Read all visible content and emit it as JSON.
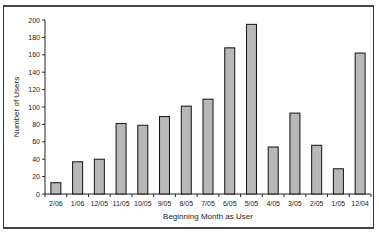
{
  "chart_data": {
    "type": "bar",
    "title": "",
    "xlabel": "Beginning Month as User",
    "ylabel": "Number of Users",
    "ylim": [
      0,
      200
    ],
    "yticks": [
      0,
      20,
      40,
      60,
      80,
      100,
      120,
      140,
      160,
      180,
      200
    ],
    "categories": [
      "2/06",
      "1/06",
      "12/05",
      "11/05",
      "10/05",
      "9/05",
      "8/05",
      "7/05",
      "6/05",
      "5/05",
      "4/05",
      "3/05",
      "2/05",
      "1/05",
      "12/04"
    ],
    "values": [
      13,
      37,
      40,
      81,
      79,
      89,
      101,
      109,
      168,
      195,
      54,
      93,
      56,
      29,
      162
    ],
    "grid": false,
    "legend": null,
    "bar_color": "#b8b8b8",
    "bar_edge_color": "#111111"
  }
}
